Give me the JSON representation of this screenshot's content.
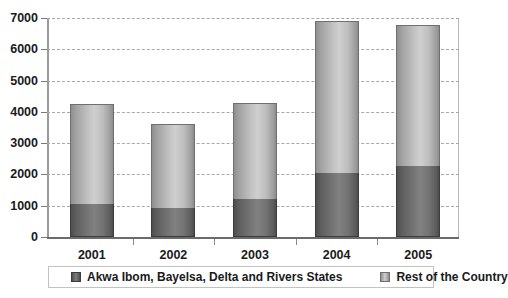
{
  "chart_data": {
    "type": "bar",
    "subtype": "stacked-column",
    "title": "",
    "xlabel": "",
    "ylabel": "",
    "categories": [
      "2001",
      "2002",
      "2003",
      "2004",
      "2005"
    ],
    "series": [
      {
        "name": "Akwa Ibom, Bayelsa, Delta and Rivers States",
        "color": "#6b6b6b",
        "values": [
          1050,
          930,
          1220,
          2050,
          2270
        ]
      },
      {
        "name": "Rest of the Country",
        "color": "#c4c4c4",
        "values": [
          3200,
          2680,
          3070,
          4850,
          4510
        ]
      }
    ],
    "totals": [
      4250,
      3610,
      4290,
      6900,
      6780
    ],
    "ylim": [
      0,
      7000
    ],
    "yticks": [
      0,
      1000,
      2000,
      3000,
      4000,
      5000,
      6000,
      7000
    ],
    "ytick_labels": [
      "0",
      "1000",
      "2000",
      "3000",
      "4000",
      "5000",
      "6000",
      "7000"
    ],
    "grid": true,
    "grid_style": "dashed",
    "legend_position": "bottom"
  },
  "legend": {
    "entries": [
      {
        "label": "Akwa Ibom, Bayelsa, Delta and Rivers States",
        "swatch": "dark-swatch"
      },
      {
        "label": "Rest of the Country",
        "swatch": "light-swatch"
      }
    ]
  }
}
